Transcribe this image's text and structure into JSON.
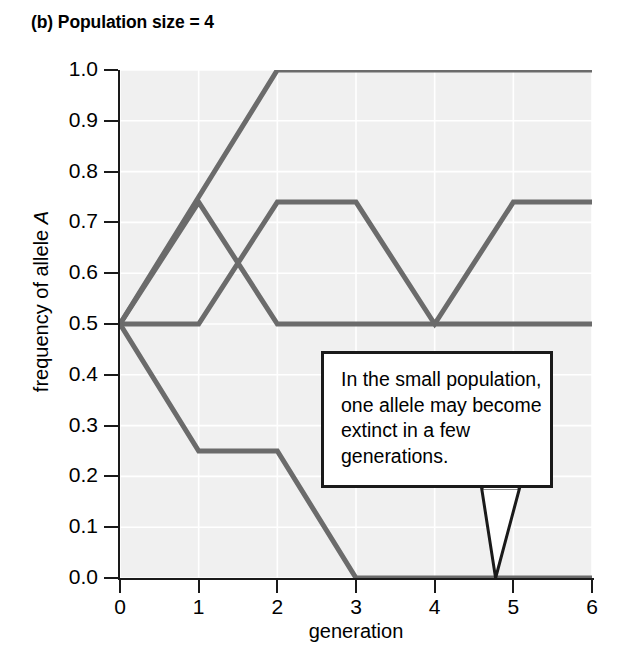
{
  "figure": {
    "title": "(b) Population size = 4",
    "background_color": "#ffffff",
    "plot_background_color": "#f0f0f0",
    "gridline_color": "#ffffff",
    "axis_color": "#1a1a1a",
    "line_color": "#6b6b6b"
  },
  "annotation": {
    "text": "In the small population, one allele may become extinct in a few generations.",
    "border_color": "#1a1a1a",
    "background_color": "#ffffff",
    "points_to": {
      "x": 4.8,
      "y": 0.0
    }
  },
  "chart_data": {
    "type": "line",
    "title": "(b) Population size = 4",
    "xlabel": "generation",
    "ylabel": "frequency of allele A",
    "xlim": [
      0,
      6
    ],
    "ylim": [
      0.0,
      1.0
    ],
    "grid": true,
    "legend": "none",
    "x": [
      0,
      1,
      2,
      3,
      4,
      5,
      6
    ],
    "xticks": [
      "0",
      "1",
      "2",
      "3",
      "4",
      "5",
      "6"
    ],
    "yticks": [
      "0.0",
      "0.1",
      "0.2",
      "0.3",
      "0.4",
      "0.5",
      "0.6",
      "0.7",
      "0.8",
      "0.9",
      "1.0"
    ],
    "series": [
      {
        "name": "replicate-1-fixed",
        "color": "#6b6b6b",
        "values": [
          0.5,
          0.75,
          1.0,
          1.0,
          1.0,
          1.0,
          1.0
        ]
      },
      {
        "name": "replicate-2-fluctuating",
        "color": "#6b6b6b",
        "values": [
          0.5,
          0.5,
          0.74,
          0.74,
          0.5,
          0.74,
          0.74
        ]
      },
      {
        "name": "replicate-3-stable",
        "color": "#6b6b6b",
        "values": [
          0.5,
          0.74,
          0.5,
          0.5,
          0.5,
          0.5,
          0.5
        ]
      },
      {
        "name": "replicate-4-extinct",
        "color": "#6b6b6b",
        "values": [
          0.5,
          0.25,
          0.25,
          0.0,
          0.0,
          0.0,
          0.0
        ]
      }
    ]
  }
}
